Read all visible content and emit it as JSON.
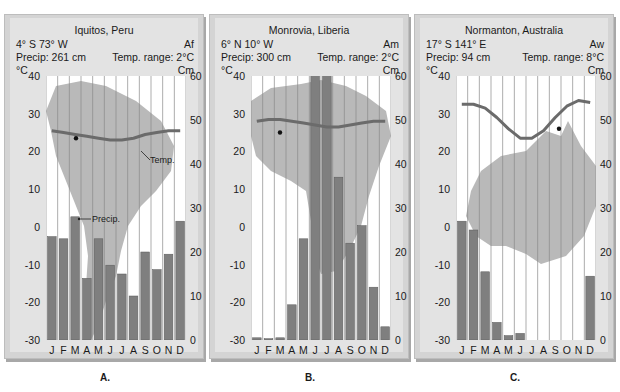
{
  "chart_data": [
    {
      "type": "bar+line",
      "panel_label": "A.",
      "title": "Iquitos, Peru",
      "coords": "4° S 73° W",
      "climate_code": "Af",
      "precip_total": "Precip: 261 cm",
      "temp_range": "Temp. range: 2°C",
      "left_axis_unit": "°C",
      "right_axis_unit": "Cm",
      "left_ticks": [
        "40",
        "30",
        "20",
        "10",
        "0",
        "-10",
        "-20",
        "-30"
      ],
      "right_ticks": [
        "60",
        "50",
        "40",
        "30",
        "20",
        "10",
        "0"
      ],
      "ylim_temp": [
        -30,
        40
      ],
      "ylim_precip": [
        0,
        60
      ],
      "categories": [
        "J",
        "F",
        "M",
        "A",
        "M",
        "J",
        "J",
        "A",
        "S",
        "O",
        "N",
        "D"
      ],
      "series": [
        {
          "name": "Precip. (cm)",
          "values": [
            23.5,
            23,
            28,
            14,
            23,
            17,
            15,
            10,
            20,
            16,
            19.5,
            27
          ]
        },
        {
          "name": "Temp. (°C)",
          "values": [
            25.5,
            25,
            24.5,
            24,
            23.5,
            23,
            23,
            23.5,
            24.5,
            25,
            25.5,
            25.5
          ]
        }
      ],
      "annotations": [
        "Temp.",
        "Precip."
      ],
      "map": "South America"
    },
    {
      "type": "bar+line",
      "panel_label": "B.",
      "title": "Monrovia, Liberia",
      "coords": "6° N 10° W",
      "climate_code": "Am",
      "precip_total": "Precip: 300 cm",
      "temp_range": "Temp. range: 2°C",
      "left_axis_unit": "°C",
      "right_axis_unit": "Cm",
      "left_ticks": [
        "40",
        "30",
        "20",
        "10",
        "0",
        "-10",
        "-20",
        "-30"
      ],
      "right_ticks": [
        "60",
        "50",
        "40",
        "30",
        "20",
        "10",
        "0"
      ],
      "ylim_temp": [
        -30,
        40
      ],
      "ylim_precip": [
        0,
        60
      ],
      "categories": [
        "J",
        "F",
        "M",
        "A",
        "M",
        "J",
        "J",
        "A",
        "S",
        "O",
        "N",
        "D"
      ],
      "series": [
        {
          "name": "Precip. (cm)",
          "values": [
            0.5,
            0.3,
            0.5,
            8,
            23,
            98,
            90,
            37,
            22,
            26,
            12,
            3
          ]
        },
        {
          "name": "Temp. (°C)",
          "values": [
            28,
            28.5,
            28.5,
            28,
            27.5,
            27,
            26.5,
            26.5,
            27,
            27.5,
            28,
            28
          ]
        }
      ],
      "annotations": [],
      "map": "Africa"
    },
    {
      "type": "bar+line",
      "panel_label": "C.",
      "title": "Normanton, Australia",
      "coords": "17° S 141° E",
      "climate_code": "Aw",
      "precip_total": "Precip: 94 cm",
      "temp_range": "Temp. range: 8°C",
      "left_axis_unit": "°C",
      "right_axis_unit": "Cm",
      "left_ticks": [
        "40",
        "30",
        "20",
        "10",
        "0",
        "-10",
        "-20",
        "-30"
      ],
      "right_ticks": [
        "60",
        "50",
        "40",
        "30",
        "20",
        "10",
        "0"
      ],
      "ylim_temp": [
        -30,
        40
      ],
      "ylim_precip": [
        0,
        60
      ],
      "categories": [
        "J",
        "F",
        "M",
        "A",
        "M",
        "J",
        "J",
        "A",
        "S",
        "O",
        "N",
        "D"
      ],
      "series": [
        {
          "name": "Precip. (cm)",
          "values": [
            27,
            25,
            15.5,
            4,
            1,
            1.5,
            0,
            0,
            0,
            0,
            0,
            14.5
          ]
        },
        {
          "name": "Temp. (°C)",
          "values": [
            32.5,
            32.5,
            31.5,
            29,
            26,
            23.5,
            23.5,
            25.5,
            29,
            32,
            33.5,
            33
          ]
        }
      ],
      "annotations": [],
      "map": "Australia"
    }
  ],
  "colors": {
    "bar": "#7f7f7f",
    "bar_edge": "#5a5a5a",
    "temp_line": "#6b6b6b",
    "map": "#b9b9b9",
    "gridline": "#8a8a8a",
    "panel_bg": "#e3e3e3",
    "plot_bg": "#ffffff"
  }
}
